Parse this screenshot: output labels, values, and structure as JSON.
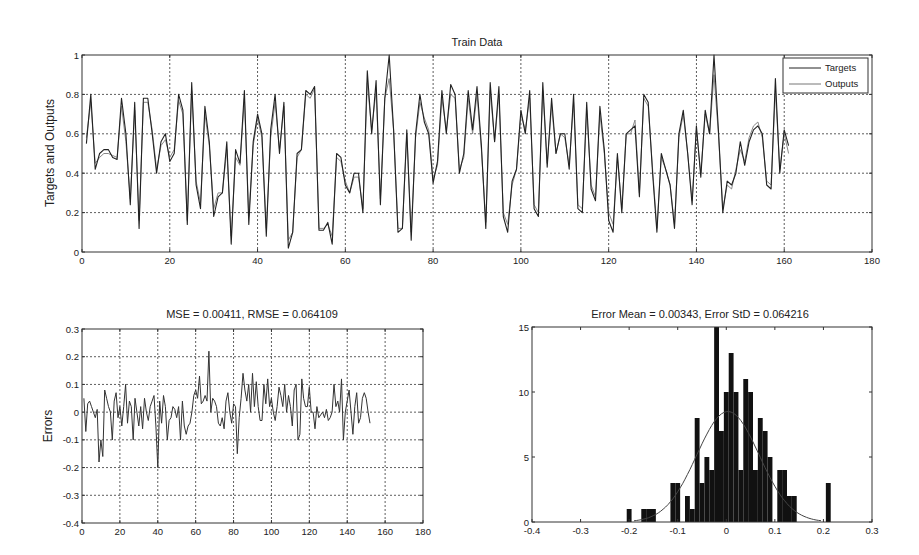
{
  "figure": {
    "top": {
      "title": "Train Data",
      "ylabel": "Targets and Outputs",
      "xlabel": "",
      "xticks": [
        "0",
        "20",
        "40",
        "60",
        "80",
        "100",
        "120",
        "140",
        "160",
        "180"
      ],
      "yticks": [
        "0",
        "0.2",
        "0.4",
        "0.6",
        "0.8",
        "1"
      ],
      "legend": [
        "Targets",
        "Outputs"
      ]
    },
    "bottom_left": {
      "title": "MSE = 0.00411, RMSE = 0.064109",
      "ylabel": "Errors",
      "xticks": [
        "0",
        "20",
        "40",
        "60",
        "80",
        "100",
        "120",
        "140",
        "160",
        "180"
      ],
      "yticks": [
        "-0.4",
        "-0.3",
        "-0.2",
        "-0.1",
        "0",
        "0.1",
        "0.2",
        "0.3"
      ]
    },
    "bottom_right": {
      "title": "Error Mean = 0.00343, Error StD = 0.064216",
      "xticks": [
        "-0.4",
        "-0.3",
        "-0.2",
        "-0.1",
        "0",
        "0.1",
        "0.2",
        "0.3"
      ],
      "yticks": [
        "0",
        "5",
        "10",
        "15"
      ]
    }
  },
  "chart_data": [
    {
      "type": "line",
      "title": "Train Data",
      "xlabel": "",
      "ylabel": "Targets and Outputs",
      "xlim": [
        0,
        180
      ],
      "ylim": [
        0,
        1
      ],
      "grid": true,
      "legend_position": "upper right",
      "x_start": 1,
      "series": [
        {
          "name": "Targets",
          "values": [
            0.55,
            0.8,
            0.42,
            0.5,
            0.52,
            0.52,
            0.48,
            0.47,
            0.78,
            0.6,
            0.24,
            0.76,
            0.12,
            0.78,
            0.78,
            0.6,
            0.4,
            0.56,
            0.6,
            0.46,
            0.5,
            0.8,
            0.72,
            0.14,
            0.86,
            0.34,
            0.22,
            0.74,
            0.56,
            0.18,
            0.28,
            0.3,
            0.56,
            0.04,
            0.52,
            0.45,
            0.82,
            0.14,
            0.56,
            0.7,
            0.6,
            0.08,
            0.62,
            0.8,
            0.5,
            0.76,
            0.02,
            0.1,
            0.5,
            0.52,
            0.82,
            0.8,
            0.84,
            0.11,
            0.11,
            0.15,
            0.04,
            0.5,
            0.48,
            0.34,
            0.3,
            0.4,
            0.4,
            0.2,
            0.92,
            0.6,
            0.87,
            0.24,
            0.78,
            1.0,
            0.62,
            0.1,
            0.12,
            0.62,
            0.06,
            0.6,
            0.8,
            0.66,
            0.6,
            0.35,
            0.46,
            0.82,
            0.6,
            0.85,
            0.8,
            0.4,
            0.5,
            0.82,
            0.62,
            0.84,
            0.54,
            0.12,
            0.86,
            0.56,
            0.84,
            0.18,
            0.1,
            0.36,
            0.42,
            0.72,
            0.6,
            0.82,
            0.22,
            0.18,
            0.86,
            0.43,
            0.78,
            0.5,
            0.6,
            0.6,
            0.42,
            0.8,
            0.22,
            0.2,
            0.76,
            0.32,
            0.26,
            0.74,
            0.52,
            0.16,
            0.1,
            0.5,
            0.2,
            0.6,
            0.62,
            0.64,
            0.28,
            0.8,
            0.76,
            0.4,
            0.1,
            0.5,
            0.42,
            0.34,
            0.12,
            0.6,
            0.72,
            0.5,
            0.24,
            0.64,
            0.38,
            0.72,
            0.6,
            1.0,
            0.62,
            0.2,
            0.36,
            0.34,
            0.4,
            0.56,
            0.44,
            0.56,
            0.62,
            0.64,
            0.6,
            0.34,
            0.32,
            0.88,
            0.4,
            0.62,
            0.54
          ]
        },
        {
          "name": "Outputs",
          "values": [
            0.58,
            0.76,
            0.45,
            0.48,
            0.5,
            0.5,
            0.49,
            0.48,
            0.74,
            0.56,
            0.27,
            0.72,
            0.16,
            0.76,
            0.76,
            0.62,
            0.42,
            0.54,
            0.57,
            0.48,
            0.52,
            0.77,
            0.7,
            0.16,
            0.82,
            0.36,
            0.25,
            0.7,
            0.54,
            0.22,
            0.3,
            0.3,
            0.52,
            0.08,
            0.48,
            0.44,
            0.78,
            0.18,
            0.54,
            0.68,
            0.58,
            0.12,
            0.58,
            0.76,
            0.52,
            0.74,
            0.06,
            0.1,
            0.48,
            0.52,
            0.8,
            0.78,
            0.83,
            0.12,
            0.12,
            0.14,
            0.08,
            0.48,
            0.46,
            0.36,
            0.3,
            0.38,
            0.38,
            0.22,
            0.86,
            0.62,
            0.82,
            0.27,
            0.78,
            0.88,
            0.62,
            0.12,
            0.12,
            0.6,
            0.1,
            0.58,
            0.76,
            0.68,
            0.62,
            0.37,
            0.44,
            0.78,
            0.62,
            0.8,
            0.78,
            0.42,
            0.48,
            0.78,
            0.6,
            0.8,
            0.52,
            0.15,
            0.82,
            0.56,
            0.8,
            0.2,
            0.14,
            0.34,
            0.42,
            0.7,
            0.62,
            0.78,
            0.24,
            0.2,
            0.82,
            0.45,
            0.74,
            0.5,
            0.6,
            0.58,
            0.44,
            0.76,
            0.24,
            0.22,
            0.72,
            0.34,
            0.28,
            0.7,
            0.5,
            0.2,
            0.14,
            0.48,
            0.22,
            0.6,
            0.6,
            0.67,
            0.3,
            0.78,
            0.74,
            0.42,
            0.12,
            0.48,
            0.42,
            0.34,
            0.14,
            0.58,
            0.7,
            0.5,
            0.26,
            0.62,
            0.4,
            0.7,
            0.6,
            0.9,
            0.6,
            0.22,
            0.34,
            0.32,
            0.42,
            0.52,
            0.46,
            0.58,
            0.64,
            0.66,
            0.58,
            0.36,
            0.34,
            0.82,
            0.42,
            0.6,
            0.5
          ]
        }
      ]
    },
    {
      "type": "line",
      "title": "MSE = 0.00411, RMSE = 0.064109",
      "xlabel": "",
      "ylabel": "Errors",
      "xlim": [
        0,
        180
      ],
      "ylim": [
        -0.4,
        0.3
      ],
      "grid": true,
      "x_start": 1,
      "series": [
        {
          "name": "Errors",
          "values": [
            0.05,
            -0.07,
            0.03,
            0.04,
            0.02,
            0.0,
            -0.02,
            0.01,
            -0.18,
            -0.1,
            -0.16,
            0.08,
            0.05,
            0.02,
            0.0,
            -0.1,
            0.04,
            0.07,
            -0.02,
            0.02,
            -0.05,
            0.02,
            0.1,
            -0.04,
            0.04,
            0.02,
            -0.1,
            0.05,
            0.0,
            -0.05,
            0.02,
            -0.06,
            0.05,
            0.0,
            -0.03,
            0.02,
            0.04,
            0.06,
            -0.05,
            -0.2,
            0.04,
            -0.04,
            0.06,
            0.02,
            -0.1,
            -0.03,
            -0.02,
            0.02,
            0.01,
            -0.02,
            0.02,
            -0.1,
            0.04,
            -0.05,
            -0.08,
            -0.05,
            -0.04,
            0.0,
            0.06,
            0.08,
            0.05,
            0.13,
            0.03,
            0.04,
            0.06,
            0.04,
            0.22,
            0.0,
            0.05,
            0.04,
            0.02,
            -0.04,
            -0.05,
            -0.02,
            -0.06,
            0.04,
            0.07,
            0.0,
            -0.04,
            0.03,
            0.02,
            -0.15,
            -0.02,
            0.05,
            0.14,
            0.08,
            0.04,
            0.1,
            0.0,
            0.14,
            0.02,
            0.11,
            0.02,
            -0.03,
            -0.03,
            0.1,
            0.03,
            0.12,
            0.02,
            0.05,
            0.0,
            -0.03,
            0.02,
            0.09,
            0.06,
            0.02,
            0.1,
            0.0,
            0.06,
            0.02,
            -0.05,
            0.08,
            0.1,
            -0.1,
            -0.08,
            0.12,
            0.05,
            0.02,
            0.02,
            0.09,
            0.0,
            0.0,
            -0.06,
            0.02,
            -0.02,
            -0.01,
            0.0,
            -0.02,
            0.01,
            -0.03,
            -0.02,
            0.0,
            0.1,
            0.02,
            0.04,
            0.0,
            0.12,
            -0.1,
            0.0,
            0.04,
            0.08,
            0.0,
            -0.08,
            0.02,
            0.07,
            -0.04,
            -0.02,
            0.05,
            0.07,
            0.05,
            0.0,
            -0.04
          ]
        }
      ]
    },
    {
      "type": "bar",
      "subtype": "histogram",
      "title": "Error Mean = 0.00343, Error StD = 0.064216",
      "xlabel": "",
      "ylabel": "",
      "xlim": [
        -0.4,
        0.3
      ],
      "ylim": [
        0,
        15
      ],
      "grid": false,
      "bin_width": 0.01,
      "categories": [
        -0.2,
        -0.17,
        -0.16,
        -0.15,
        -0.11,
        -0.1,
        -0.08,
        -0.07,
        -0.06,
        -0.05,
        -0.04,
        -0.03,
        -0.02,
        -0.01,
        0.0,
        0.01,
        0.02,
        0.03,
        0.04,
        0.05,
        0.06,
        0.07,
        0.08,
        0.09,
        0.11,
        0.12,
        0.13,
        0.14,
        0.21
      ],
      "values": [
        1,
        1,
        1,
        1,
        3,
        3,
        2,
        1,
        8,
        3,
        5,
        4,
        15,
        7,
        10,
        13,
        10,
        4,
        11,
        10,
        4,
        8,
        7,
        5,
        4,
        4,
        2,
        2,
        3,
        1,
        1
      ],
      "fit_curve": {
        "type": "normal",
        "mean": 0.00343,
        "std": 0.064216,
        "peak": 8.5
      }
    }
  ]
}
